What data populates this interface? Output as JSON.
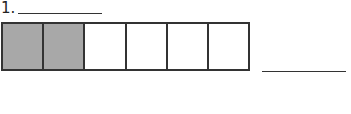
{
  "question": {
    "number_label": "1.",
    "name_blank": "",
    "answer_blank": ""
  },
  "fraction_bar": {
    "total_parts": 6,
    "shaded_parts": 2,
    "cells": [
      {
        "shaded": true
      },
      {
        "shaded": true
      },
      {
        "shaded": false
      },
      {
        "shaded": false
      },
      {
        "shaded": false
      },
      {
        "shaded": false
      }
    ],
    "colors": {
      "shaded": "#a8a8a8",
      "unshaded": "#ffffff",
      "border": "#333333"
    }
  }
}
